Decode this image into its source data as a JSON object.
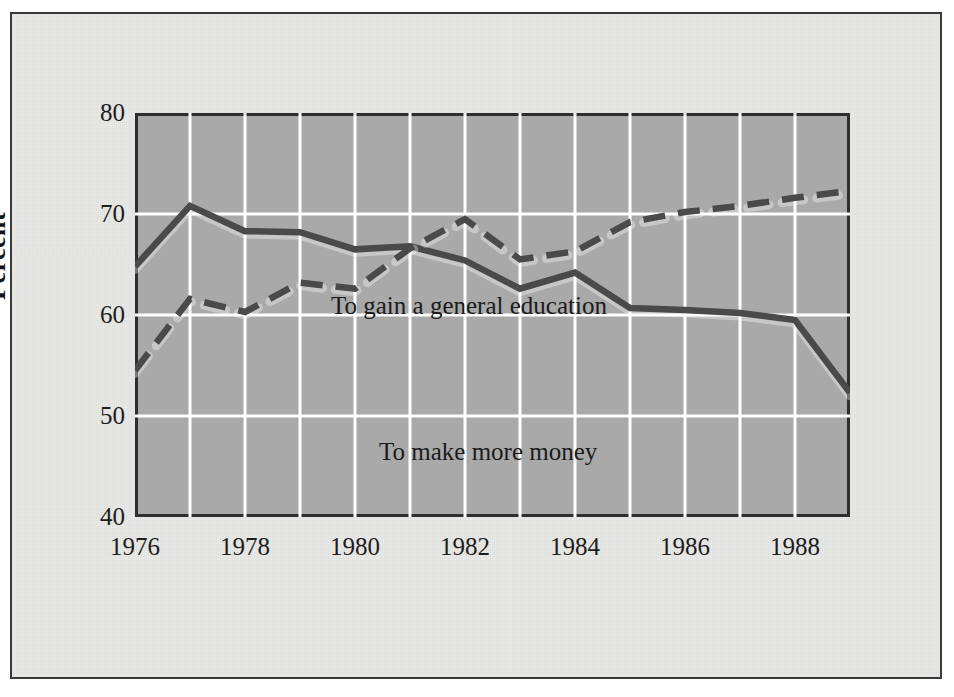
{
  "chart_data": {
    "type": "line",
    "title": "",
    "subtitle": "",
    "xlabel": "",
    "ylabel": "Percent",
    "xlim": [
      1976,
      1989
    ],
    "ylim": [
      40,
      80
    ],
    "grid": true,
    "grid_color": "#ffffff",
    "plot_background": "#a9a9a9",
    "page_background": "#e9e9e7",
    "legend_position": "inline-annotations",
    "x": [
      1976,
      1977,
      1978,
      1979,
      1980,
      1981,
      1982,
      1983,
      1984,
      1985,
      1986,
      1987,
      1988,
      1989
    ],
    "xticks": [
      1976,
      1978,
      1980,
      1982,
      1984,
      1986,
      1988
    ],
    "xtick_labels": [
      "1976",
      "1978",
      "1980",
      "1982",
      "1984",
      "1986",
      "1988"
    ],
    "yticks": [
      40,
      50,
      60,
      70,
      80
    ],
    "ytick_labels": [
      "40",
      "50",
      "60",
      "70",
      "80"
    ],
    "series": [
      {
        "name": "To gain a general education",
        "style": "solid",
        "color": "#4a4a4a",
        "values": [
          64.8,
          70.8,
          68.3,
          68.2,
          66.5,
          66.8,
          65.4,
          62.6,
          64.2,
          60.7,
          60.5,
          60.2,
          59.5,
          52.3
        ]
      },
      {
        "name": "To make more money",
        "style": "dashed",
        "color": "#4a4a4a",
        "values": [
          54.5,
          61.6,
          60.3,
          63.2,
          62.6,
          66.6,
          69.5,
          65.5,
          66.3,
          69.2,
          70.2,
          70.8,
          71.6,
          72.3
        ]
      }
    ],
    "annotations": [
      {
        "text": "To gain a general education",
        "x": 1979.0,
        "y": 72.3
      },
      {
        "text": "To make more money",
        "x": 1980.0,
        "y": 58.0
      }
    ]
  },
  "axis": {
    "y_title": "Percent"
  }
}
